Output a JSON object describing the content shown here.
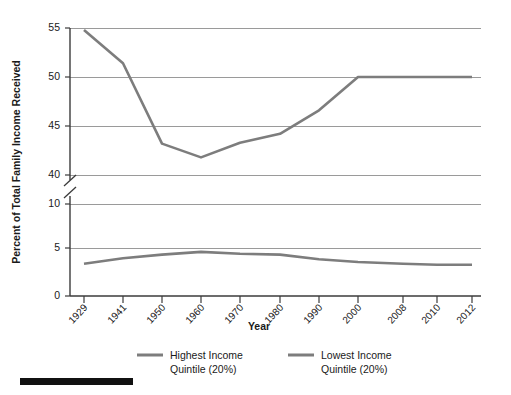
{
  "chart_data": {
    "type": "line",
    "title": "",
    "xlabel": "Year",
    "ylabel": "Percent of Total Family Income Received",
    "categories": [
      "1929",
      "1941",
      "1950",
      "1960",
      "1970",
      "1980",
      "1990",
      "2000",
      "2008",
      "2010",
      "2012"
    ],
    "yticks": [
      0,
      5,
      10,
      40,
      45,
      50,
      55
    ],
    "ylim": [
      0,
      55
    ],
    "axis_break": {
      "present": true,
      "from": 10,
      "to": 40,
      "note": "y-axis broken between 10 and 40"
    },
    "grid": true,
    "legend_position": "bottom",
    "series": [
      {
        "name": "Highest Income Quintile (20%)",
        "color": "#7d7d7d",
        "values": [
          54.8,
          51.4,
          43.2,
          41.8,
          43.3,
          44.2,
          46.6,
          50.0,
          50.0,
          50.0,
          50.0
        ]
      },
      {
        "name": "Lowest Income Quintile (20%)",
        "color": "#7d7d7d",
        "values": [
          3.5,
          4.1,
          4.5,
          4.8,
          4.6,
          4.5,
          4.0,
          3.7,
          3.5,
          3.4,
          3.4
        ]
      }
    ]
  },
  "axes": {
    "ylabel": "Percent of Total Family Income Received",
    "xlabel": "Year",
    "ytick_labels": [
      "0",
      "5",
      "10",
      "40",
      "45",
      "50",
      "55"
    ],
    "xtick_labels": [
      "1929",
      "1941",
      "1950",
      "1960",
      "1970",
      "1980",
      "1990",
      "2000",
      "2008",
      "2010",
      "2012"
    ]
  },
  "legend": {
    "items": [
      {
        "label_line1": "Highest Income",
        "label_line2": "Quintile (20%)",
        "color": "#7d7d7d"
      },
      {
        "label_line1": "Lowest Income",
        "label_line2": "Quintile (20%)",
        "color": "#7d7d7d"
      }
    ]
  },
  "footer": {
    "bar_color": "#111111"
  }
}
